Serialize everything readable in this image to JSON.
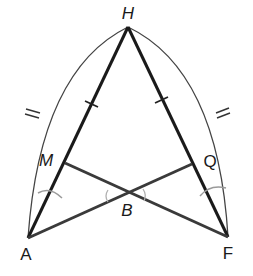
{
  "diagram": {
    "type": "geometry-construction",
    "colors": {
      "background": "#ffffff",
      "main_lines": "#1a1a1a",
      "cross_lines": "#3a3a3a",
      "outer_arcs": "#444444",
      "construction_marks": "#9a9a9a"
    },
    "points": {
      "H": {
        "label": "H",
        "x": 128,
        "y": 27,
        "label_x": 128,
        "label_y": 12
      },
      "A": {
        "label": "A",
        "x": 28,
        "y": 238,
        "label_x": 26,
        "label_y": 255
      },
      "F": {
        "label": "F",
        "x": 228,
        "y": 237,
        "label_x": 228,
        "label_y": 254
      },
      "M": {
        "label": "M",
        "x": 65,
        "y": 163,
        "label_x": 48,
        "label_y": 160
      },
      "Q": {
        "label": "Q",
        "x": 192,
        "y": 164,
        "label_x": 211,
        "label_y": 161
      },
      "B": {
        "label": "B",
        "x": 127,
        "y": 195,
        "label_x": 127,
        "label_y": 210
      }
    },
    "segments": [
      {
        "from": "H",
        "to": "A",
        "style": "main"
      },
      {
        "from": "H",
        "to": "F",
        "style": "main"
      },
      {
        "from": "M",
        "to": "F",
        "style": "cross"
      },
      {
        "from": "Q",
        "to": "A",
        "style": "cross"
      }
    ],
    "arcs": [
      {
        "name": "arc-HA",
        "from": "H",
        "to": "A",
        "style": "outer"
      },
      {
        "name": "arc-HF",
        "from": "H",
        "to": "F",
        "style": "outer"
      }
    ],
    "tick_marks": [
      {
        "on": "HA",
        "count": 1
      },
      {
        "on": "HF",
        "count": 1
      },
      {
        "on": "arc-HA",
        "count": 2
      },
      {
        "on": "arc-HF",
        "count": 2
      }
    ],
    "construction_marks": [
      {
        "near": "AM"
      },
      {
        "near": "B-left"
      },
      {
        "near": "B-right"
      },
      {
        "near": "QF"
      }
    ]
  }
}
